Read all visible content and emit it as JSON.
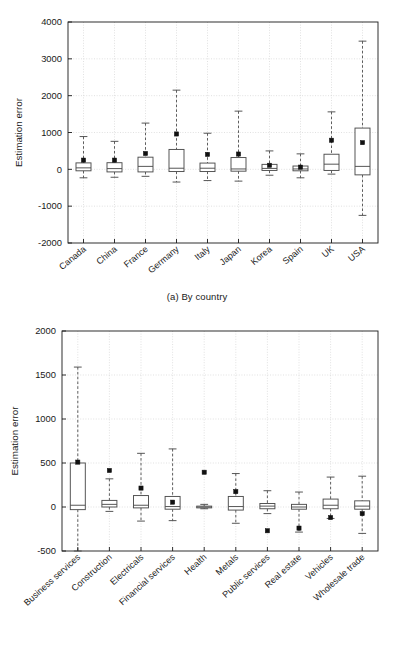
{
  "figure": {
    "panels": [
      {
        "id": "a",
        "caption": "(a) By country"
      },
      {
        "id": "b",
        "caption": "(b) By 'from-sector'"
      }
    ],
    "colors": {
      "ink": "#1a1a1a",
      "box_stroke": "#4d4d4d",
      "whisker": "#4d4d4d",
      "grid": "#cccccc",
      "mean_marker": "#111111",
      "background": "#ffffff"
    }
  },
  "chart_data": [
    {
      "type": "box",
      "panel": "a",
      "title": "",
      "caption": "(a) By country",
      "xlabel": "",
      "ylabel": "Estimation error",
      "ylim": [
        -2000,
        4000
      ],
      "yticks": [
        -2000,
        -1000,
        0,
        1000,
        2000,
        3000,
        4000
      ],
      "ytick_labels": [
        "-2000",
        "-1000",
        "0",
        "1000",
        "2000",
        "3000",
        "4000"
      ],
      "grid": true,
      "legend": "none",
      "categories": [
        "Canada",
        "China",
        "France",
        "Germany",
        "Italy",
        "Japan",
        "Korea",
        "Spain",
        "UK",
        "USA"
      ],
      "boxes": [
        {
          "category": "Canada",
          "whisker_low": -230,
          "q1": -40,
          "median": 40,
          "q3": 175,
          "whisker_high": 890,
          "mean": 250
        },
        {
          "category": "China",
          "whisker_low": -215,
          "q1": -70,
          "median": 20,
          "q3": 180,
          "whisker_high": 760,
          "mean": 250
        },
        {
          "category": "France",
          "whisker_low": -190,
          "q1": -70,
          "median": 80,
          "q3": 330,
          "whisker_high": 1255,
          "mean": 430
        },
        {
          "category": "Germany",
          "whisker_low": -345,
          "q1": -60,
          "median": 30,
          "q3": 540,
          "whisker_high": 2150,
          "mean": 960
        },
        {
          "category": "Italy",
          "whisker_low": -305,
          "q1": -60,
          "median": 30,
          "q3": 170,
          "whisker_high": 980,
          "mean": 405
        },
        {
          "category": "Japan",
          "whisker_low": -320,
          "q1": -50,
          "median": 10,
          "q3": 320,
          "whisker_high": 1580,
          "mean": 415
        },
        {
          "category": "Korea",
          "whisker_low": -160,
          "q1": -30,
          "median": 25,
          "q3": 135,
          "whisker_high": 500,
          "mean": 110
        },
        {
          "category": "Spain",
          "whisker_low": -230,
          "q1": -40,
          "median": 10,
          "q3": 90,
          "whisker_high": 420,
          "mean": 60
        },
        {
          "category": "UK",
          "whisker_low": -130,
          "q1": -30,
          "median": 140,
          "q3": 410,
          "whisker_high": 1560,
          "mean": 790
        },
        {
          "category": "USA",
          "whisker_low": -1250,
          "q1": -150,
          "median": 80,
          "q3": 1120,
          "whisker_high": 3480,
          "mean": 725
        }
      ]
    },
    {
      "type": "box",
      "panel": "b",
      "title": "",
      "caption": "(b) By 'from-sector'",
      "xlabel": "",
      "ylabel": "Estimation error",
      "ylim": [
        -500,
        2000
      ],
      "yticks": [
        -500,
        0,
        500,
        1000,
        1500,
        2000
      ],
      "ytick_labels": [
        "-500",
        "0",
        "500",
        "1000",
        "1500",
        "2000"
      ],
      "grid": true,
      "legend": "none",
      "categories": [
        "Business services",
        "Construction",
        "Electricals",
        "Financial services",
        "Health",
        "Metals",
        "Public services",
        "Real estate",
        "Vehicles",
        "Wholesale trade"
      ],
      "boxes": [
        {
          "category": "Business services",
          "whisker_low": -500,
          "q1": -30,
          "median": 20,
          "q3": 500,
          "whisker_high": 1590,
          "mean": 510
        },
        {
          "category": "Construction",
          "whisker_low": -50,
          "q1": 0,
          "median": 30,
          "q3": 75,
          "whisker_high": 320,
          "mean": 415
        },
        {
          "category": "Electricals",
          "whisker_low": -160,
          "q1": -10,
          "median": 20,
          "q3": 130,
          "whisker_high": 610,
          "mean": 215
        },
        {
          "category": "Financial services",
          "whisker_low": -155,
          "q1": -25,
          "median": 5,
          "q3": 120,
          "whisker_high": 660,
          "mean": 55
        },
        {
          "category": "Health",
          "whisker_low": -20,
          "q1": -10,
          "median": 0,
          "q3": 10,
          "whisker_high": 30,
          "mean": 395
        },
        {
          "category": "Metals",
          "whisker_low": -185,
          "q1": -35,
          "median": 5,
          "q3": 120,
          "whisker_high": 380,
          "mean": 175
        },
        {
          "category": "Public services",
          "whisker_low": -75,
          "q1": -20,
          "median": 10,
          "q3": 40,
          "whisker_high": 185,
          "mean": -270
        },
        {
          "category": "Real estate",
          "whisker_low": -285,
          "q1": -25,
          "median": 0,
          "q3": 30,
          "whisker_high": 170,
          "mean": -240
        },
        {
          "category": "Vehicles",
          "whisker_low": -130,
          "q1": -20,
          "median": 20,
          "q3": 90,
          "whisker_high": 340,
          "mean": -120
        },
        {
          "category": "Wholesale trade",
          "whisker_low": -300,
          "q1": -25,
          "median": 10,
          "q3": 70,
          "whisker_high": 350,
          "mean": -75
        }
      ]
    }
  ]
}
